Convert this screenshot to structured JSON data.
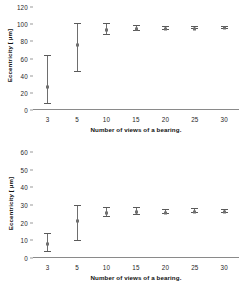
{
  "chart_data": [
    {
      "type": "scatter",
      "id": "top",
      "title": "",
      "xlabel": "Number of views of a bearing.",
      "ylabel": "Eccentricity [  µm]",
      "categories": [
        "3",
        "5",
        "10",
        "15",
        "20",
        "25",
        "30"
      ],
      "ylim": [
        0,
        120
      ],
      "yticks": [
        "0",
        "20",
        "40",
        "60",
        "80",
        "100",
        "120"
      ],
      "grid": false,
      "legend": "none",
      "errorbars": true,
      "values": [
        28,
        78,
        95,
        96,
        96,
        96.5,
        97
      ],
      "lower": [
        8,
        45,
        88,
        93,
        94,
        95,
        96
      ],
      "upper": [
        64,
        101,
        101,
        99,
        98,
        98,
        98
      ]
    },
    {
      "type": "scatter",
      "id": "bottom",
      "title": "",
      "xlabel": "Number of views of a bearing.",
      "ylabel": "Eccentricity [  µm]",
      "categories": [
        "3",
        "5",
        "10",
        "15",
        "20",
        "25",
        "30"
      ],
      "ylim": [
        0,
        60
      ],
      "yticks": [
        "0",
        "10",
        "20",
        "30",
        "40",
        "50",
        "60"
      ],
      "grid": false,
      "legend": "none",
      "errorbars": true,
      "values": [
        9,
        22,
        26.5,
        27,
        26.5,
        27,
        27
      ],
      "lower": [
        4,
        10,
        24,
        25,
        25.5,
        26,
        26
      ],
      "upper": [
        14,
        30,
        29,
        29,
        27.5,
        28.5,
        28
      ]
    }
  ],
  "colors": {
    "axis": "#8a8a8a",
    "marker": "#707070",
    "whisker": "#6e6e6e",
    "text": "#1a1a1a",
    "background": "#ffffff"
  }
}
